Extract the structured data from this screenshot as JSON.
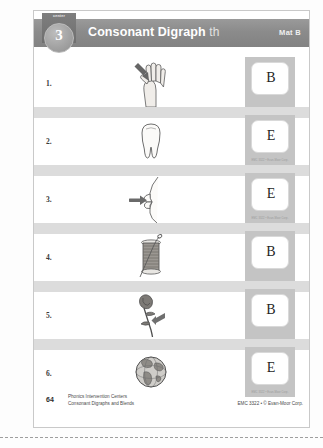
{
  "header": {
    "badge_label": "center",
    "badge_number": "3",
    "title_main": "Consonant Digraph",
    "title_sound": "th",
    "mat_label": "Mat B"
  },
  "rows": [
    {
      "number": "1.",
      "picture": "thumb",
      "picture_icon": "hand-thumb-icon",
      "answer_letter": "B",
      "card_code": ""
    },
    {
      "number": "2.",
      "picture": "tooth",
      "picture_icon": "tooth-icon",
      "answer_letter": "E",
      "card_code": "EMC 3322 • Evan-Moor Corp."
    },
    {
      "number": "3.",
      "picture": "teeth/mouth",
      "picture_icon": "mouth-lips-icon",
      "answer_letter": "E",
      "card_code": "EMC 3322 • Evan-Moor Corp."
    },
    {
      "number": "4.",
      "picture": "thread",
      "picture_icon": "thread-spool-icon",
      "answer_letter": "B",
      "card_code": ""
    },
    {
      "number": "5.",
      "picture": "thorn",
      "picture_icon": "rose-thorn-icon",
      "answer_letter": "B",
      "card_code": ""
    },
    {
      "number": "6.",
      "picture": "earth",
      "picture_icon": "globe-earth-icon",
      "answer_letter": "E",
      "card_code": "EMC 3322 • Evan-Moor Corp."
    }
  ],
  "footer": {
    "page_number": "64",
    "series_line1": "Phonics Intervention Centers",
    "series_line2": "Consonant Digraphs and Blends",
    "copyright": "EMC 3322 • © Evan-Moor Corp."
  },
  "colors": {
    "header_band": "#8b8b8b",
    "separator_band": "#dcdcdc",
    "card_tile": "#c4c4c4",
    "page_background": "#ffffff"
  }
}
